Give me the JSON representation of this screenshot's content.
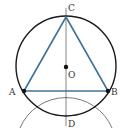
{
  "diagram": {
    "colors": {
      "circle": "#1a1a1a",
      "triangle": "#3f7399",
      "guide": "#555555",
      "point": "#111111"
    },
    "circle": {
      "center": "O",
      "cx": 66,
      "cy": 66,
      "r": 50
    },
    "arc": {
      "center": "D",
      "cx": 66,
      "cy": 116,
      "r": 50
    },
    "points": [
      {
        "name": "A",
        "x": 24,
        "y": 91,
        "label": "A",
        "lx": 9,
        "ly": 95
      },
      {
        "name": "B",
        "x": 108,
        "y": 91,
        "label": "B",
        "lx": 111,
        "ly": 95
      },
      {
        "name": "C",
        "x": 66,
        "y": 17,
        "label": "C",
        "lx": 68,
        "ly": 11
      },
      {
        "name": "O",
        "x": 66,
        "y": 67,
        "label": "O",
        "lx": 68,
        "ly": 78
      },
      {
        "name": "D",
        "x": 66,
        "y": 116,
        "label": "D",
        "lx": 68,
        "ly": 127
      }
    ],
    "segments": [
      "AB",
      "BC",
      "CA",
      "CD"
    ]
  }
}
